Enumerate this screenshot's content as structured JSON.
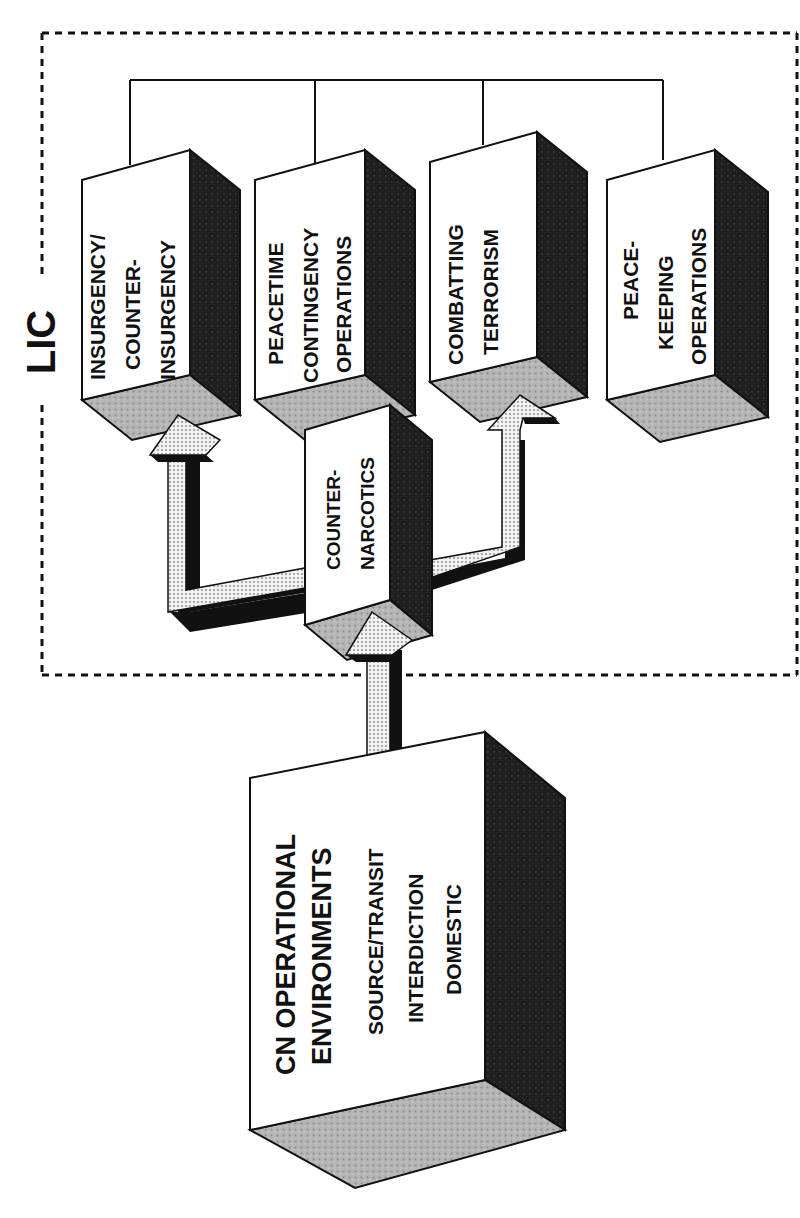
{
  "diagram": {
    "group_label": "LIC",
    "lic_operations": [
      {
        "id": "insurgency",
        "lines": [
          "INSURGENCY/",
          "COUNTER-",
          "INSURGENCY"
        ]
      },
      {
        "id": "peacetime",
        "lines": [
          "PEACETIME",
          "CONTINGENCY",
          "OPERATIONS"
        ]
      },
      {
        "id": "terrorism",
        "lines": [
          "COMBATTING",
          "TERRORISM"
        ]
      },
      {
        "id": "peacekeeping",
        "lines": [
          "PEACE-",
          "KEEPING",
          "OPERATIONS"
        ]
      }
    ],
    "counter_narcotics": {
      "lines": [
        "COUNTER-",
        "NARCOTICS"
      ]
    },
    "cn_environments": {
      "title_lines": [
        "CN OPERATIONAL",
        "ENVIRONMENTS"
      ],
      "items": [
        "SOURCE/TRANSIT",
        "INTERDICTION",
        "DOMESTIC"
      ]
    },
    "flows": [
      {
        "from": "CN OPERATIONAL ENVIRONMENTS",
        "to": "COUNTER-NARCOTICS"
      },
      {
        "from": "COUNTER-NARCOTICS",
        "to": "INSURGENCY/COUNTER-INSURGENCY"
      },
      {
        "from": "COUNTER-NARCOTICS",
        "to": "COMBATTING TERRORISM"
      }
    ],
    "colors": {
      "ink": "#111111",
      "dark_face": "#2a2a2a",
      "light_face": "#bdbdbd",
      "arrow_fill": "#d9d9d9",
      "background": "#ffffff"
    }
  }
}
